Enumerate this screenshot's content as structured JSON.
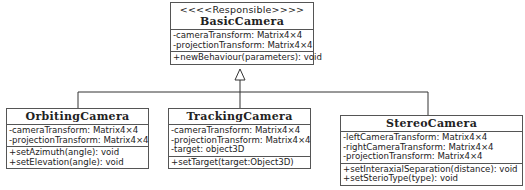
{
  "diagram": {
    "type": "uml-class-diagram",
    "relation": "generalization",
    "base": {
      "stereotype": "<<<<Responsible>>>>",
      "name": "BasicCamera",
      "attributes": [
        "-cameraTransform: Matrix4×4",
        "-projectionTransform: Matrix4×4"
      ],
      "operations": [
        "+newBehaviour(parameters): void"
      ]
    },
    "subclasses": [
      {
        "name": "OrbitingCamera",
        "attributes": [
          "-cameraTransform: Matrix4×4",
          "-projectionTransform: Matrix4×4"
        ],
        "operations": [
          "+setAzimuth(angle): void",
          "+setElevation(angle): void"
        ]
      },
      {
        "name": "TrackingCamera",
        "attributes": [
          "-cameraTransform: Matrix4×4",
          "-projectionTransform: Matrix4×4",
          "-target: object3D"
        ],
        "operations": [
          "+setTarget(target:Object3D)"
        ]
      },
      {
        "name": "StereoCamera",
        "attributes": [
          "-leftCameraTransform: Matrix4×4",
          "-rightCameraTransform: Matrix4×4",
          "-projectionTransform: Matrix4×4"
        ],
        "operations": [
          "+setInteraxialSeparation(distance): void",
          "+setSterioType(type): void"
        ]
      }
    ]
  }
}
